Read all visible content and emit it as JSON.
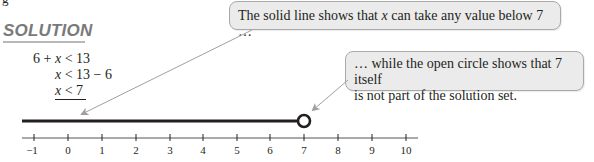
{
  "heading": {
    "clipped_text": "g",
    "title": "SOLUTION"
  },
  "steps": [
    {
      "pre": "6 + ",
      "var": "x",
      "post": " < 13"
    },
    {
      "pre": "",
      "var": "x",
      "post": " < 13 − 6"
    },
    {
      "pre": "",
      "var": "x",
      "post": " < 7"
    }
  ],
  "callouts": {
    "solid_line": {
      "text_before": "The solid line shows that ",
      "var": "x",
      "text_after": " can take any value below 7 …"
    },
    "open_circle": {
      "line1": "… while the open circle shows that 7 itself",
      "line2": "is not part of the solution set."
    }
  },
  "number_line": {
    "min": -1,
    "max": 10,
    "tick_labels": [
      "−1",
      "0",
      "1",
      "2",
      "3",
      "4",
      "5",
      "6",
      "7",
      "8",
      "9",
      "10"
    ],
    "solution": {
      "type": "x < 7",
      "endpoint": 7,
      "endpoint_style": "open-circle",
      "direction": "left"
    }
  },
  "colors": {
    "heading": "#7a7a7a",
    "callout_bg": "#ebebeb",
    "callout_border": "#a9a9a9",
    "arrow": "#a0a0a0",
    "ink": "#231f20"
  }
}
